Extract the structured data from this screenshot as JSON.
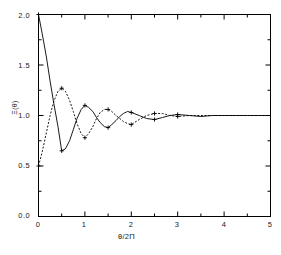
{
  "chart_data": {
    "type": "line",
    "title": "",
    "xlabel": "θ/2Π",
    "ylabel": "Ξ(θ)",
    "xlim": [
      0,
      5
    ],
    "ylim": [
      0.0,
      2.0
    ],
    "xticks": [
      0,
      1,
      2,
      3,
      4,
      5
    ],
    "xticklabels": [
      "0",
      "1",
      "2",
      "3",
      "4",
      "5"
    ],
    "yticks": [
      0.0,
      0.5,
      1.0,
      1.5,
      2.0
    ],
    "yticklabels": [
      "0.0",
      "0.5",
      "1.0",
      "1.5",
      "2.0"
    ],
    "minor_xtick_step": 0.5,
    "minor_ytick_step": 0.25,
    "grid": false,
    "legend": "none",
    "frame": "box",
    "series": [
      {
        "name": "upper-branch",
        "linestyle": "solid",
        "marker": "plus",
        "color": "#000000",
        "x": [
          0.0,
          0.08,
          0.17,
          0.25,
          0.33,
          0.42,
          0.5,
          0.58,
          0.67,
          0.75,
          0.83,
          0.92,
          1.0,
          1.08,
          1.17,
          1.25,
          1.33,
          1.42,
          1.5,
          1.58,
          1.67,
          1.75,
          1.83,
          1.92,
          2.0,
          2.17,
          2.33,
          2.5,
          2.67,
          2.83,
          3.0,
          3.25,
          3.5,
          3.75,
          4.0,
          4.25,
          4.5,
          4.75,
          5.0
        ],
        "y": [
          2.0,
          1.81,
          1.58,
          1.34,
          1.12,
          0.89,
          0.65,
          0.67,
          0.75,
          0.86,
          0.97,
          1.06,
          1.1,
          1.08,
          1.04,
          0.98,
          0.93,
          0.89,
          0.88,
          0.91,
          0.95,
          0.99,
          1.02,
          1.04,
          1.03,
          1.0,
          0.97,
          0.96,
          0.98,
          1.0,
          1.01,
          1.0,
          0.99,
          1.0,
          1.0,
          1.0,
          1.0,
          1.0,
          1.0
        ],
        "markers_at_x": [
          0.0,
          0.5,
          1.0,
          1.5,
          2.0,
          2.5,
          3.0
        ]
      },
      {
        "name": "lower-branch",
        "linestyle": "dashed",
        "marker": "plus",
        "color": "#000000",
        "x": [
          0.0,
          0.08,
          0.17,
          0.25,
          0.33,
          0.42,
          0.5,
          0.58,
          0.67,
          0.75,
          0.83,
          0.92,
          1.0,
          1.08,
          1.17,
          1.25,
          1.33,
          1.42,
          1.5,
          1.58,
          1.67,
          1.75,
          1.83,
          1.92,
          2.0,
          2.17,
          2.33,
          2.5,
          2.67,
          2.83,
          3.0,
          3.25,
          3.5,
          3.75,
          4.0,
          4.25,
          4.5,
          4.75,
          5.0
        ],
        "y": [
          0.5,
          0.64,
          0.83,
          1.0,
          1.14,
          1.24,
          1.27,
          1.24,
          1.15,
          1.04,
          0.92,
          0.82,
          0.78,
          0.82,
          0.89,
          0.97,
          1.03,
          1.06,
          1.06,
          1.04,
          1.0,
          0.97,
          0.94,
          0.92,
          0.91,
          0.96,
          1.0,
          1.02,
          1.02,
          1.0,
          0.99,
          1.0,
          1.0,
          1.0,
          1.0,
          1.0,
          1.0,
          1.0,
          1.0
        ],
        "markers_at_x": [
          0.0,
          0.5,
          1.0,
          1.5,
          2.0,
          2.5,
          3.0
        ]
      }
    ],
    "asymptote": 1.0
  }
}
